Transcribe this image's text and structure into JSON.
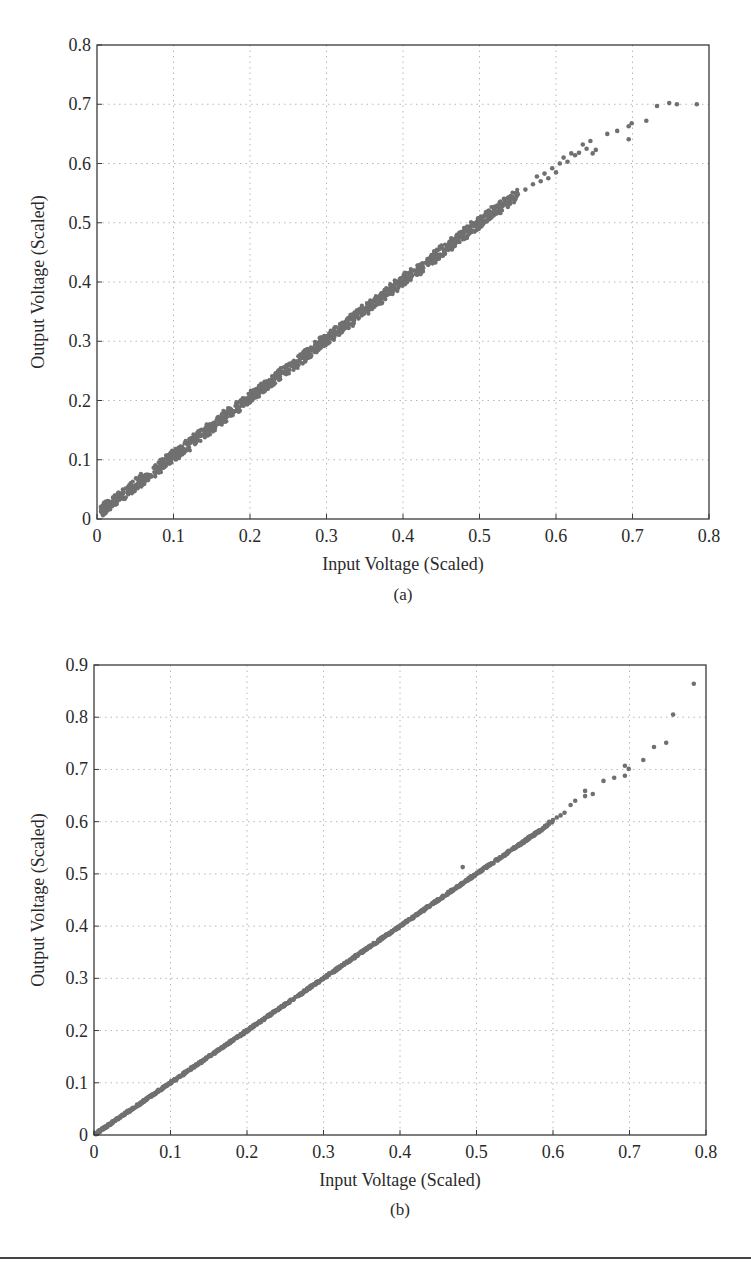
{
  "chart_data": [
    {
      "type": "scatter",
      "panel_label": "(a)",
      "title": "",
      "xlabel": "Input Voltage (Scaled)",
      "ylabel": "Output Voltage (Scaled)",
      "xlim": [
        0,
        0.8
      ],
      "ylim": [
        0,
        0.8
      ],
      "xticks": [
        "0",
        "0.1",
        "0.2",
        "0.3",
        "0.4",
        "0.5",
        "0.6",
        "0.7",
        "0.8"
      ],
      "yticks": [
        "0",
        "0.1",
        "0.2",
        "0.3",
        "0.4",
        "0.5",
        "0.6",
        "0.7",
        "0.8"
      ],
      "grid": true,
      "grid_style": "dotted",
      "legend": null,
      "marker_color": "#707070",
      "band_description": "Dense noisy band of points approximately following y = x from 0 to ~0.55, band half-width ~0.01",
      "band": {
        "x_start": 0.005,
        "x_end": 0.55,
        "slope": 0.985,
        "intercept": 0.008,
        "spread": 0.012
      },
      "points": [
        [
          0.55,
          0.548
        ],
        [
          0.56,
          0.556
        ],
        [
          0.57,
          0.565
        ],
        [
          0.575,
          0.578
        ],
        [
          0.58,
          0.57
        ],
        [
          0.585,
          0.583
        ],
        [
          0.59,
          0.575
        ],
        [
          0.595,
          0.592
        ],
        [
          0.6,
          0.585
        ],
        [
          0.605,
          0.6
        ],
        [
          0.61,
          0.61
        ],
        [
          0.615,
          0.603
        ],
        [
          0.62,
          0.617
        ],
        [
          0.625,
          0.614
        ],
        [
          0.63,
          0.618
        ],
        [
          0.635,
          0.632
        ],
        [
          0.64,
          0.625
        ],
        [
          0.645,
          0.638
        ],
        [
          0.648,
          0.617
        ],
        [
          0.652,
          0.623
        ],
        [
          0.667,
          0.65
        ],
        [
          0.68,
          0.655
        ],
        [
          0.695,
          0.663
        ],
        [
          0.699,
          0.668
        ],
        [
          0.695,
          0.641
        ],
        [
          0.718,
          0.672
        ],
        [
          0.732,
          0.697
        ],
        [
          0.748,
          0.702
        ],
        [
          0.758,
          0.7
        ],
        [
          0.784,
          0.7
        ]
      ]
    },
    {
      "type": "scatter",
      "panel_label": "(b)",
      "title": "",
      "xlabel": "Input Voltage (Scaled)",
      "ylabel": "Output Voltage (Scaled)",
      "xlim": [
        0,
        0.8
      ],
      "ylim": [
        0,
        0.9
      ],
      "xticks": [
        "0",
        "0.1",
        "0.2",
        "0.3",
        "0.4",
        "0.5",
        "0.6",
        "0.7",
        "0.8"
      ],
      "yticks": [
        "0",
        "0.1",
        "0.2",
        "0.3",
        "0.4",
        "0.5",
        "0.6",
        "0.7",
        "0.8",
        "0.9"
      ],
      "grid": true,
      "grid_style": "dotted",
      "legend": null,
      "marker_color": "#707070",
      "band_description": "Tight line of points along y = x from 0 to ~0.6",
      "band": {
        "x_start": 0.002,
        "x_end": 0.6,
        "slope": 1.0,
        "intercept": 0.0,
        "spread": 0.003
      },
      "points": [
        [
          0.482,
          0.513
        ],
        [
          0.59,
          0.592
        ],
        [
          0.595,
          0.6
        ],
        [
          0.6,
          0.603
        ],
        [
          0.605,
          0.608
        ],
        [
          0.61,
          0.612
        ],
        [
          0.615,
          0.617
        ],
        [
          0.623,
          0.632
        ],
        [
          0.629,
          0.64
        ],
        [
          0.642,
          0.649
        ],
        [
          0.642,
          0.659
        ],
        [
          0.652,
          0.653
        ],
        [
          0.666,
          0.678
        ],
        [
          0.68,
          0.684
        ],
        [
          0.694,
          0.688
        ],
        [
          0.694,
          0.707
        ],
        [
          0.699,
          0.701
        ],
        [
          0.718,
          0.718
        ],
        [
          0.732,
          0.743
        ],
        [
          0.748,
          0.751
        ],
        [
          0.757,
          0.805
        ],
        [
          0.784,
          0.864
        ]
      ]
    }
  ]
}
